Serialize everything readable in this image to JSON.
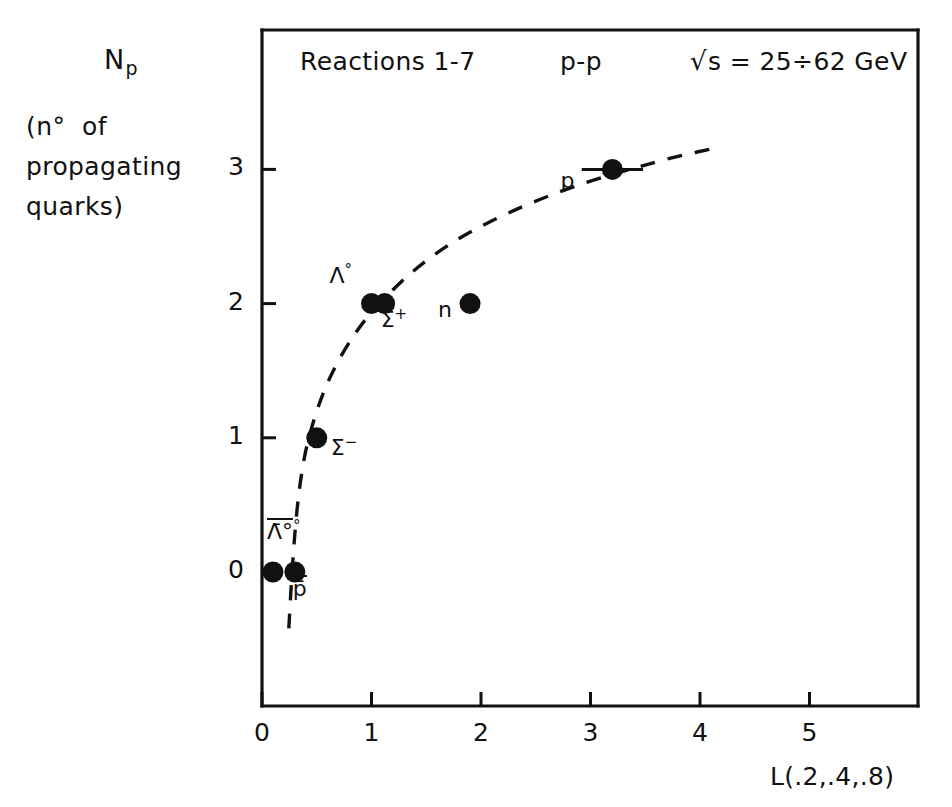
{
  "axis_caption": {
    "symbol_main": "N",
    "symbol_sub": "p",
    "line_1": "(n°  of",
    "line_2": "propagating",
    "line_3": "quarks)"
  },
  "header": {
    "reactions": "Reactions 1-7",
    "system": "p-p",
    "energy_radical": "√",
    "energy_text": "s = 25÷62 GeV"
  },
  "x_axis_title": "L(.2,.4,.8)",
  "chart_data": {
    "type": "scatter",
    "title": "Reactions 1-7   p-p   √s = 25÷62 GeV",
    "xlabel": "L(.2,.4,.8)",
    "ylabel": "N_p (n° of propagating quarks)",
    "xlim": [
      0,
      6
    ],
    "ylim": [
      -0.85,
      3.9
    ],
    "xticks": [
      0,
      1,
      2,
      3,
      4,
      5
    ],
    "xtick_labels": [
      "0",
      "1",
      "2",
      "3",
      "4",
      "5"
    ],
    "yticks": [
      0,
      1,
      2,
      3
    ],
    "ytick_labels": [
      "0",
      "1",
      "2",
      "3"
    ],
    "grid": false,
    "legend": "none",
    "marker_color": "#111111",
    "curve_color": "#111111",
    "curve_style": "dashed",
    "points": [
      {
        "label": "Λ̄°",
        "label_plain": "anti-Lambda0",
        "x": 0.1,
        "y": 0,
        "xerr": 0,
        "label_dx": -6,
        "label_dy": -42,
        "overbar": true,
        "sup": "°"
      },
      {
        "label": "p̄",
        "label_plain": "anti-p",
        "x": 0.3,
        "y": 0,
        "xerr": 0,
        "label_dx": -2,
        "label_dy": 16,
        "overbar": true,
        "sup": ""
      },
      {
        "label": "Σ",
        "label_plain": "Sigma-minus",
        "x": 0.5,
        "y": 1,
        "xerr": 0,
        "label_dx": 14,
        "label_dy": 8,
        "overbar": false,
        "sup": "−"
      },
      {
        "label": "Λ",
        "label_plain": "Lambda0",
        "x": 1.0,
        "y": 2,
        "xerr": 0,
        "label_dx": -42,
        "label_dy": -30,
        "overbar": false,
        "sup": "°"
      },
      {
        "label": "Σ",
        "label_plain": "Sigma-plus",
        "x": 1.12,
        "y": 2,
        "xerr": 0,
        "label_dx": -4,
        "label_dy": 14,
        "overbar": false,
        "sup": "+"
      },
      {
        "label": "n",
        "label_plain": "neutron",
        "x": 1.9,
        "y": 2,
        "xerr": 0,
        "label_dx": -32,
        "label_dy": 6,
        "overbar": false,
        "sup": ""
      },
      {
        "label": "p",
        "label_plain": "proton",
        "x": 3.2,
        "y": 3,
        "xerr": 0.28,
        "label_dx": -52,
        "label_dy": 12,
        "overbar": false,
        "sup": ""
      }
    ],
    "curve_points": [
      [
        0.245,
        -0.42
      ],
      [
        0.27,
        -0.05
      ],
      [
        0.3,
        0.3
      ],
      [
        0.34,
        0.62
      ],
      [
        0.39,
        0.88
      ],
      [
        0.46,
        1.1
      ],
      [
        0.55,
        1.32
      ],
      [
        0.66,
        1.52
      ],
      [
        0.8,
        1.72
      ],
      [
        0.95,
        1.89
      ],
      [
        1.15,
        2.07
      ],
      [
        1.4,
        2.26
      ],
      [
        1.7,
        2.44
      ],
      [
        2.05,
        2.6
      ],
      [
        2.45,
        2.75
      ],
      [
        2.9,
        2.89
      ],
      [
        3.4,
        3.01
      ],
      [
        3.8,
        3.1
      ],
      [
        4.15,
        3.16
      ]
    ]
  }
}
